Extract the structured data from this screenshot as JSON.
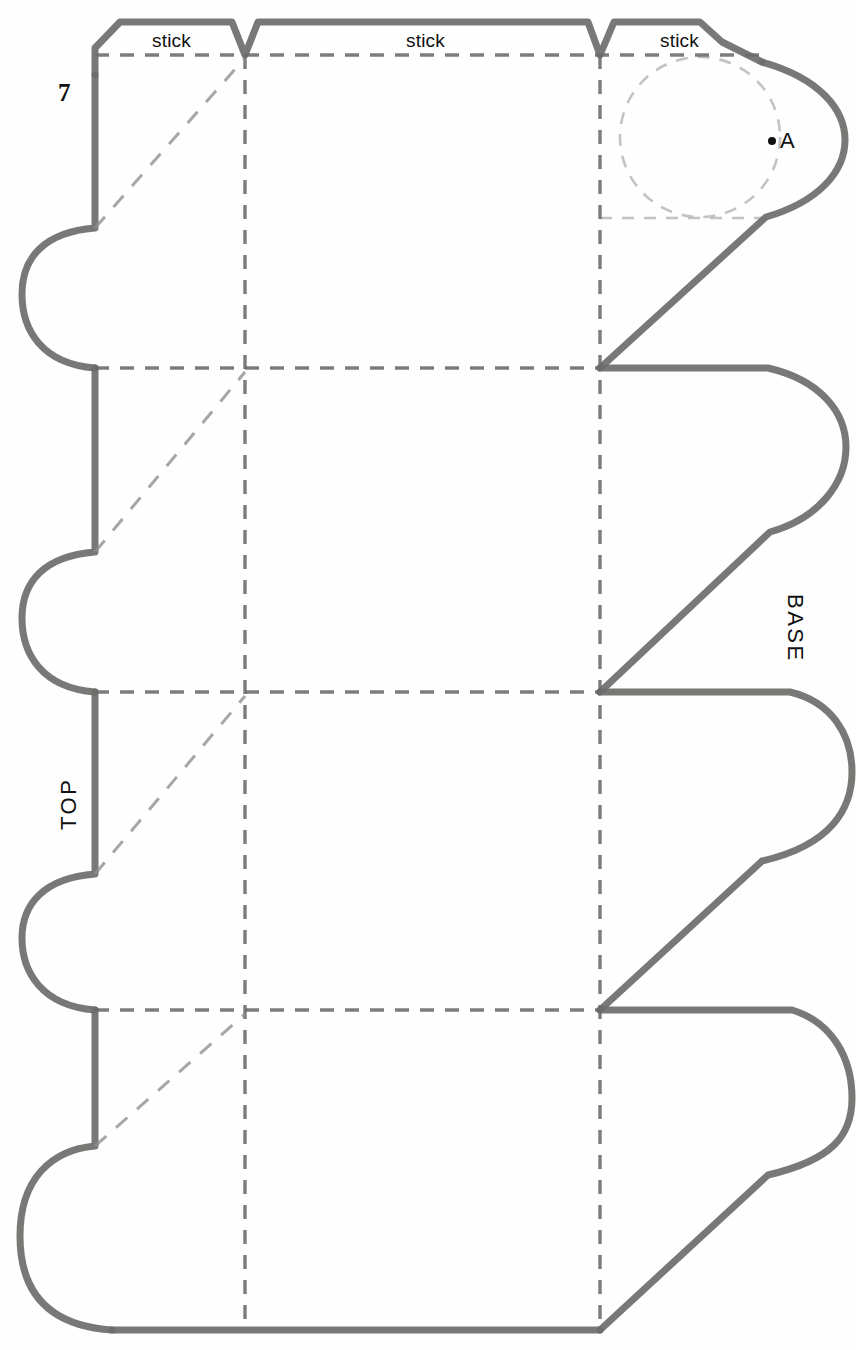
{
  "page": {
    "number": "7",
    "width": 856,
    "height": 1350,
    "background": "#ffffff"
  },
  "colors": {
    "cut_line": "#6e6c6a",
    "fold_line": "#6a6a6a",
    "ghost_line": "#b8b8b8",
    "text": "#111111"
  },
  "labels": {
    "stick_1": "stick",
    "stick_2": "stick",
    "stick_3": "stick",
    "top": "TOP",
    "base": "BASE",
    "point_a": "A"
  },
  "diagram_data": {
    "type": "net-template",
    "fold_lines_vertical_x": [
      245,
      600
    ],
    "fold_lines_horizontal_y": [
      55,
      368,
      692,
      1010
    ],
    "panel_columns": 3,
    "panel_rows": 4,
    "left_edge_x": 95,
    "left_tab_extent_x": 22,
    "right_tab_extent_x": 845,
    "bottom_edge_y": 1330,
    "glue_tabs_top": 3,
    "semicircle_tabs_left": 4,
    "rounded_tabs_right": 4,
    "ghost_circle": {
      "cx": 700,
      "cy": 137,
      "r": 80
    },
    "point_a": {
      "x": 772,
      "y": 140
    }
  }
}
